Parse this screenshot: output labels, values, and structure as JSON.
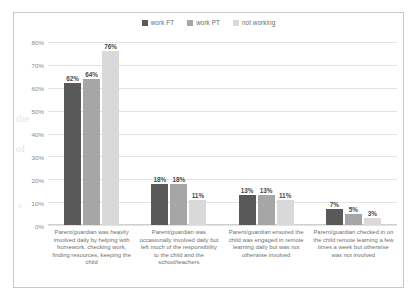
{
  "chart_data": {
    "type": "bar",
    "title": "",
    "subtitle": "",
    "xlabel": "",
    "ylabel": "",
    "ylim": [
      0,
      80
    ],
    "ytick_labels": [
      "80%",
      "70%",
      "60%",
      "50%",
      "40%",
      "30%",
      "20%",
      "10%",
      "0%"
    ],
    "ytick_values": [
      80,
      70,
      60,
      50,
      40,
      30,
      20,
      10,
      0
    ],
    "grid": true,
    "legend_position": "top-center",
    "categories": [
      "Parent/guardian was heavily involved daily by helping with homework, checking work, finding resources, keeping the child",
      "Parent/guardian was occasionally involved daily but left much of the responsibility to the child and the school/teachers",
      "Parent/guardian ensured the child was engaged in remote learning daily but was not otherwise involved",
      "Parent/guardian checked in on the child remote learning a few times a week but otherwise was not involved"
    ],
    "series": [
      {
        "name": "work FT",
        "color": "#595959",
        "values": [
          62,
          18,
          13,
          7
        ],
        "labels": [
          "62%",
          "18%",
          "13%",
          "7%"
        ]
      },
      {
        "name": "work PT",
        "color": "#a6a6a6",
        "values": [
          64,
          18,
          13,
          5
        ],
        "labels": [
          "64%",
          "18%",
          "13%",
          "5%"
        ]
      },
      {
        "name": "not working",
        "color": "#d9d9d9",
        "values": [
          76,
          11,
          11,
          3
        ],
        "labels": [
          "76%",
          "11%",
          "11%",
          "3%"
        ]
      }
    ]
  },
  "background_text": [
    {
      "text": "the",
      "x": 18,
      "y": 120,
      "size": 11
    },
    {
      "text": "of",
      "x": 18,
      "y": 150,
      "size": 11
    },
    {
      "text": "s",
      "x": 22,
      "y": 205,
      "size": 9
    },
    {
      "text": "y",
      "x": 120,
      "y": 236,
      "size": 9
    }
  ]
}
